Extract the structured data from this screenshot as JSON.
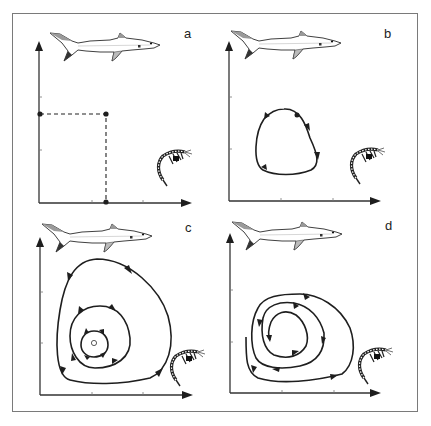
{
  "figure": {
    "frame_color": "#7a7a7a",
    "ink_color": "#1e1e1e",
    "panels": [
      {
        "id": "a",
        "label": "a",
        "content": "equilibrium point with dashed projections onto predator and prey axes",
        "predator_icon": "shark-icon",
        "prey_icon": "shrimp-icon"
      },
      {
        "id": "b",
        "label": "b",
        "content": "closed limit cycle orbit with directional arrows",
        "predator_icon": "shark-icon",
        "prey_icon": "shrimp-icon"
      },
      {
        "id": "c",
        "label": "c",
        "content": "concentric closed orbits around neutral centre point",
        "predator_icon": "shark-icon",
        "prey_icon": "shrimp-icon"
      },
      {
        "id": "d",
        "label": "d",
        "content": "inward spiral trajectory converging to stable point",
        "predator_icon": "shark-icon",
        "prey_icon": "shrimp-icon"
      }
    ],
    "axes": {
      "y_axis": "predator population (shark)",
      "x_axis": "prey population (shrimp)"
    }
  }
}
